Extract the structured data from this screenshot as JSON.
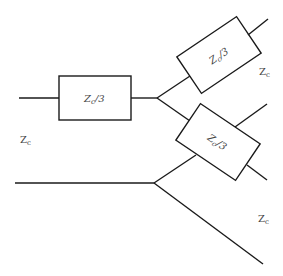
{
  "diagram": {
    "type": "circuit-network",
    "line_color": "#1a1a1a",
    "label_color": "#444444",
    "boxes": [
      {
        "id": "series",
        "label_main": "Z",
        "label_sub": "c",
        "label_tail": "/3"
      },
      {
        "id": "upper-branch",
        "label_main": "Z",
        "label_sub": "c",
        "label_tail": "/3"
      },
      {
        "id": "lower-branch",
        "label_main": "Z",
        "label_sub": "c",
        "label_tail": "/3"
      }
    ],
    "port_labels": [
      {
        "id": "left",
        "main": "Z",
        "sub": "c"
      },
      {
        "id": "right-upper",
        "main": "Z",
        "sub": "c"
      },
      {
        "id": "right-lower",
        "main": "Z",
        "sub": "c"
      }
    ]
  }
}
